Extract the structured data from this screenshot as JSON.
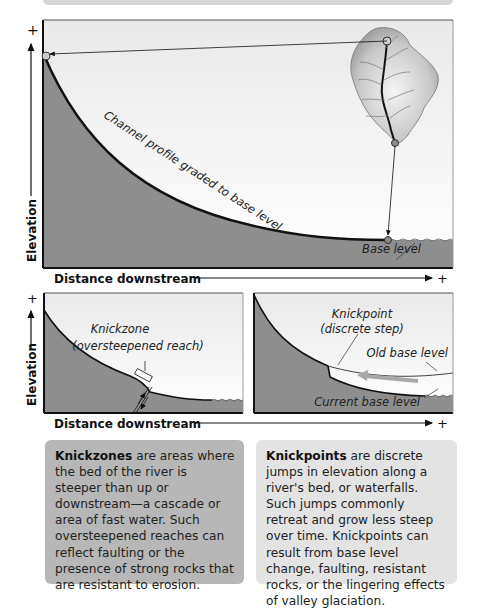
{
  "top_diagram": {
    "y_axis_label": "Elevation",
    "y_axis_plus": "+",
    "x_axis_label": "Distance downstream",
    "x_axis_plus": "+",
    "curve_label": "Channel profile graded to base level",
    "base_level_label": "Base level"
  },
  "bottom_left_diagram": {
    "y_axis_label": "Elevation",
    "y_axis_plus": "+",
    "knickzone_label_line1": "Knickzone",
    "knickzone_label_line2": "(oversteepened reach)"
  },
  "bottom_right_diagram": {
    "knickpoint_label_line1": "Knickpoint",
    "knickpoint_label_line2": "(discrete step)",
    "old_base_level_label": "Old base level",
    "current_base_level_label": "Current base level"
  },
  "bottom_axis": {
    "x_axis_label": "Distance downstream",
    "x_axis_plus": "+"
  },
  "info_boxes": {
    "knickzones": {
      "term": "Knickzones",
      "text": " are areas where the bed of the river is steeper than up or downstream—a cascade or area of fast water. Such oversteepened reaches can reflect faulting or the presence of strong rocks that are resistant to erosion."
    },
    "knickpoints": {
      "term": "Knickpoints",
      "text": " are discrete jumps in elevation along a river's bed, or waterfalls. Such jumps commonly retreat and grow less steep over time. Knickpoints can result from base level change, faulting, resistant rocks, or the lingering effects of valley glaciation."
    }
  },
  "colors": {
    "ground": "#8e8e8e",
    "sky_top": "#ececec",
    "sky_bottom": "#ffffff",
    "line": "#111111",
    "box_left": "#b7b7b7",
    "box_right": "#e3e3e3"
  }
}
